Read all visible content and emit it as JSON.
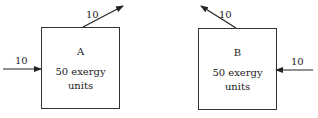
{
  "system_a": {
    "name": "A",
    "exergy_line1": "50 exergy",
    "exergy_line2": "units",
    "input": "10",
    "output": "10"
  },
  "system_b": {
    "name": "B",
    "exergy_line1": "50 exergy",
    "exergy_line2": "units",
    "input": "10",
    "output": "10"
  }
}
